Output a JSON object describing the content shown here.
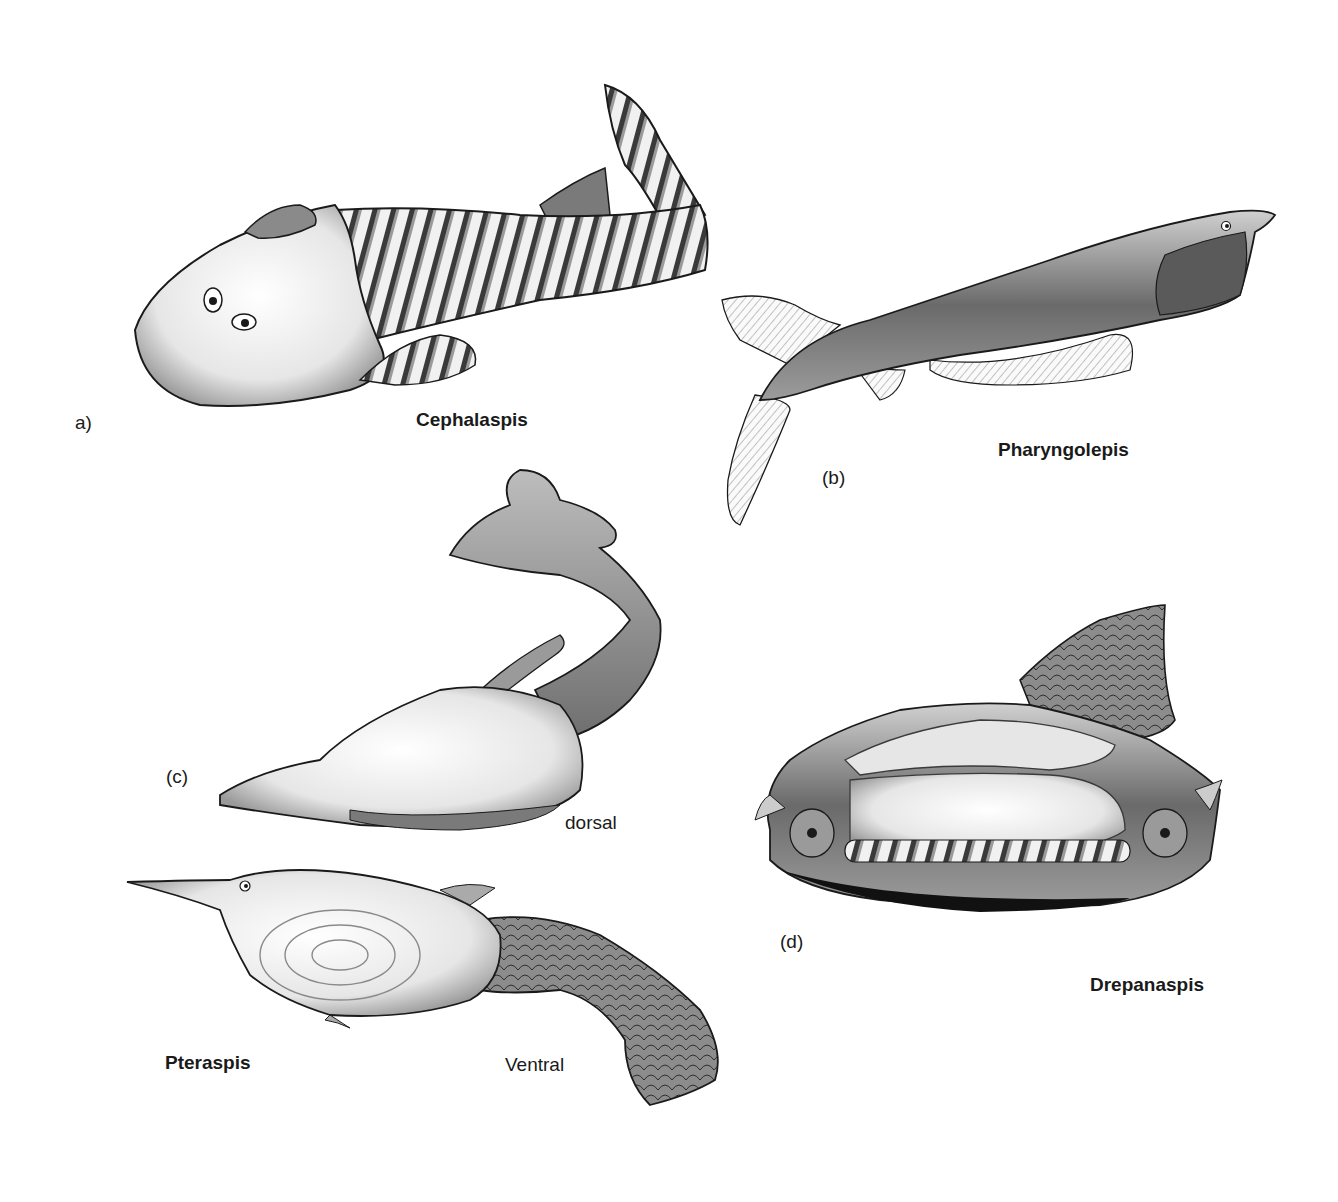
{
  "figure": {
    "panels": [
      {
        "id": "a",
        "panel_label": "a)",
        "name": "Cephalaspis"
      },
      {
        "id": "b",
        "panel_label": "(b)",
        "name": "Pharyngolepis"
      },
      {
        "id": "c",
        "panel_label": "(c)",
        "name": "Pteraspis",
        "views": [
          "dorsal",
          "Ventral"
        ]
      },
      {
        "id": "d",
        "panel_label": "(d)",
        "name": "Drepanaspis"
      }
    ]
  },
  "colors": {
    "ink": "#1a1a1a",
    "shade_dark": "#3a3a3a",
    "shade_mid": "#8a8a8a",
    "shade_light": "#d6d6d6",
    "paper": "#ffffff"
  }
}
